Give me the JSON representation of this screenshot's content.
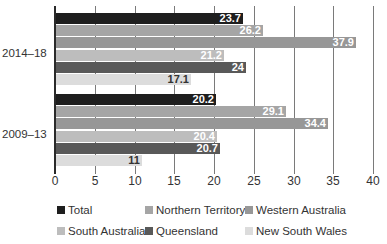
{
  "chart_data": {
    "type": "bar",
    "orientation": "horizontal",
    "title": "",
    "xlabel": "",
    "ylabel": "",
    "xlim": [
      0,
      40
    ],
    "xticks": [
      "0",
      "5",
      "10",
      "15",
      "20",
      "25",
      "30",
      "35",
      "40"
    ],
    "grid": true,
    "legend_position": "bottom",
    "categories": [
      "2014–18",
      "2009–13"
    ],
    "series": [
      {
        "name": "Total",
        "color": "#1e1e1e",
        "label_color": "#ffffff",
        "values": [
          23.7,
          20.2
        ]
      },
      {
        "name": "Northern Territory",
        "color": "#a5a5a5",
        "label_color": "#ffffff",
        "values": [
          26.2,
          29.1
        ]
      },
      {
        "name": "Western Australia",
        "color": "#979797",
        "label_color": "#ffffff",
        "values": [
          37.9,
          34.4
        ]
      },
      {
        "name": "South Australia",
        "color": "#bdbdbd",
        "label_color": "#ffffff",
        "values": [
          21.2,
          20.4
        ]
      },
      {
        "name": "Queensland",
        "color": "#595959",
        "label_color": "#ffffff",
        "values": [
          24,
          20.7
        ]
      },
      {
        "name": "New South Wales",
        "color": "#dcdcdc",
        "label_color": "#333333",
        "values": [
          17.1,
          11
        ]
      }
    ]
  }
}
